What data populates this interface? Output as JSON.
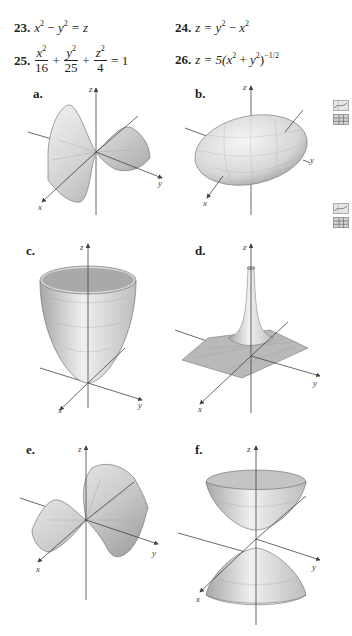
{
  "problems": [
    {
      "number": "23.",
      "equation": "x² − y² = z"
    },
    {
      "number": "24.",
      "equation": "z = y² − x²"
    },
    {
      "number": "25.",
      "equation": "x²/16 + y²/25 + z²/4 = 1"
    },
    {
      "number": "26.",
      "equation": "z = 5(x² + y²)^(−1/2)"
    }
  ],
  "p25": {
    "num": "25.",
    "t1n": "x",
    "t1d": "16",
    "t2n": "y",
    "t2d": "25",
    "t3n": "z",
    "t3d": "4",
    "plus": "+",
    "eq": "= 1"
  },
  "p23": {
    "num": "23.",
    "a": "x",
    "minus": "−",
    "b": "y",
    "rhs": "= z"
  },
  "p24": {
    "num": "24.",
    "lhs": "z =",
    "a": "y",
    "minus": "−",
    "b": "x"
  },
  "p26": {
    "num": "26.",
    "lhs": "z = 5(",
    "a": "x",
    "plus": "+",
    "b": "y",
    "close": ")",
    "exp": "−1/2"
  },
  "sup2": "2",
  "graphs": [
    {
      "label": "a.",
      "surface": "hyperbolic paraboloid (saddle, opening along x)"
    },
    {
      "label": "b.",
      "surface": "ellipsoid"
    },
    {
      "label": "c.",
      "surface": "elliptic paraboloid"
    },
    {
      "label": "d.",
      "surface": "spike / inverse radial surface"
    },
    {
      "label": "e.",
      "surface": "hyperbolic paraboloid (saddle, opening along y)"
    },
    {
      "label": "f.",
      "surface": "hyperboloid of two sheets"
    }
  ],
  "axes": {
    "x": "x",
    "y": "y",
    "z": "z"
  },
  "side_icons": [
    "graph-icon",
    "table-icon",
    "graph-icon",
    "table-icon"
  ]
}
